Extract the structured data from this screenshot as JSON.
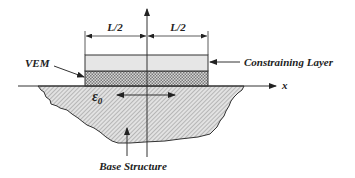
{
  "diagram": {
    "labels": {
      "half_length_left": "L/2",
      "half_length_right": "L/2",
      "constraining_layer": "Constraining Layer",
      "vem": "VEM",
      "x_axis": "x",
      "strain": "ε",
      "strain_subscript": "0",
      "base_structure": "Base Structure"
    },
    "colors": {
      "line": "#222222",
      "constraining_fill": "#e6e6e6",
      "vem_fill": "#bdbdbd",
      "base_fill": "#d4d4d4",
      "background": "#ffffff"
    }
  }
}
